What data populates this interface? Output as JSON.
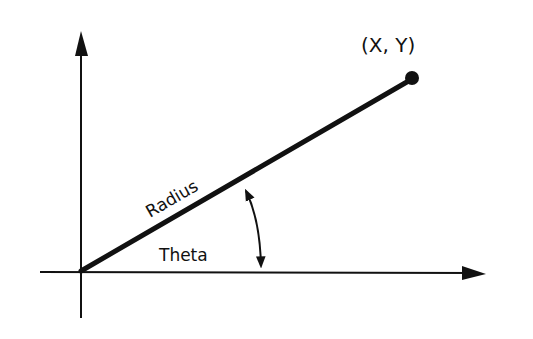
{
  "diagram": {
    "colors": {
      "background": "#ffffff",
      "stroke": "#111111"
    },
    "axes": {
      "x_axis": {
        "label": "",
        "direction": "right"
      },
      "y_axis": {
        "label": "",
        "direction": "up"
      }
    },
    "labels": {
      "point": "(X, Y)",
      "radius": "Radius",
      "theta": "Theta"
    },
    "elements": [
      {
        "id": "x-axis",
        "type": "arrow",
        "description": "horizontal axis with arrowhead pointing right"
      },
      {
        "id": "y-axis",
        "type": "arrow",
        "description": "vertical axis with arrowhead pointing up"
      },
      {
        "id": "radius-line",
        "type": "line",
        "description": "thick line from origin to point (X, Y)"
      },
      {
        "id": "endpoint",
        "type": "dot",
        "description": "filled dot marking point (X, Y)"
      },
      {
        "id": "theta-arc",
        "type": "double-arrow-arc",
        "description": "curved double-headed arrow between radius line and x-axis"
      }
    ]
  }
}
